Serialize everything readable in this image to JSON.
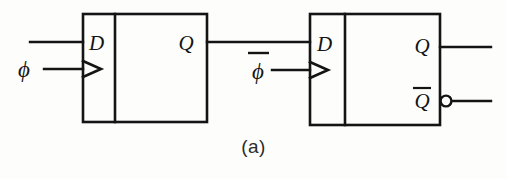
{
  "figure": {
    "caption": "(a)",
    "ink_color": "#141414",
    "background_color": "#fdfdfc"
  },
  "flipflop1": {
    "name": "flip-flop-1",
    "d_label": "D",
    "q_label": "Q",
    "clock_label": "ϕ",
    "clock_overbar": false,
    "has_qbar": false
  },
  "flipflop2": {
    "name": "flip-flop-2",
    "d_label": "D",
    "q_label": "Q",
    "qbar_label": "Q",
    "qbar_overbar": true,
    "clock_label": "ϕ",
    "clock_overbar": true,
    "has_inversion_bubble": true
  },
  "wires": {
    "d1_input": "data input to first flip-flop",
    "clk1_input": "phi clock to first flip-flop",
    "q1_to_d2": "Q of first flip-flop to D of second flip-flop",
    "clk2_input": "phi-bar clock to second flip-flop",
    "q2_output": "Q output of second flip-flop",
    "qbar2_output": "Q-bar output of second flip-flop"
  }
}
